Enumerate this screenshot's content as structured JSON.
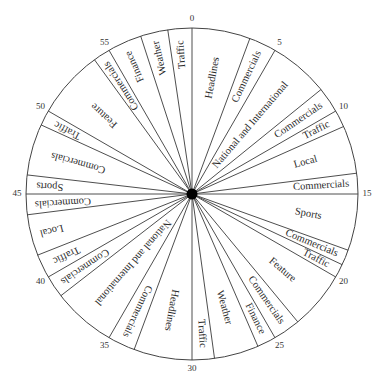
{
  "chart_data": {
    "type": "pie",
    "title": "",
    "unit": "minutes",
    "total": 60,
    "start_angle": "top (0 at 12 o'clock), clockwise",
    "tick_labels": [
      "0",
      "5",
      "10",
      "15",
      "20",
      "25",
      "30",
      "35",
      "40",
      "45",
      "50",
      "55"
    ],
    "tick_values": [
      0,
      5,
      10,
      15,
      20,
      25,
      30,
      35,
      40,
      45,
      50,
      55
    ],
    "segments": [
      {
        "label": "Headlines",
        "start": 0,
        "end": 3.4
      },
      {
        "label": "Commercials",
        "start": 3.4,
        "end": 5
      },
      {
        "label": "National and International",
        "start": 5,
        "end": 8.5
      },
      {
        "label": "Commercials",
        "start": 8.5,
        "end": 10
      },
      {
        "label": "Traffic",
        "start": 10,
        "end": 11
      },
      {
        "label": "Local",
        "start": 11,
        "end": 13.8
      },
      {
        "label": "Commercials",
        "start": 13.8,
        "end": 15
      },
      {
        "label": "Sports",
        "start": 15,
        "end": 18.3
      },
      {
        "label": "Commercials",
        "start": 18.3,
        "end": 19.2
      },
      {
        "label": "Traffic",
        "start": 19.2,
        "end": 20
      },
      {
        "label": "Feature",
        "start": 20,
        "end": 23.4
      },
      {
        "label": "Commercials",
        "start": 23.4,
        "end": 25
      },
      {
        "label": "Finance",
        "start": 25,
        "end": 26.1
      },
      {
        "label": "Weather",
        "start": 26.1,
        "end": 28.7
      },
      {
        "label": "Traffic",
        "start": 28.7,
        "end": 30
      },
      {
        "label": "Headlines",
        "start": 30,
        "end": 33.4
      },
      {
        "label": "Commercials",
        "start": 33.4,
        "end": 35
      },
      {
        "label": "National and International",
        "start": 35,
        "end": 38.7
      },
      {
        "label": "Commercials",
        "start": 38.7,
        "end": 40
      },
      {
        "label": "Traffic",
        "start": 40,
        "end": 41.4
      },
      {
        "label": "Local",
        "start": 41.4,
        "end": 43.8
      },
      {
        "label": "Commercials",
        "start": 43.8,
        "end": 45
      },
      {
        "label": "Sports",
        "start": 45,
        "end": 46.1
      },
      {
        "label": "Commercials",
        "start": 46.1,
        "end": 49.1
      },
      {
        "label": "Traffic",
        "start": 49.1,
        "end": 50
      },
      {
        "label": "Feature",
        "start": 50,
        "end": 54
      },
      {
        "label": "Commercials",
        "start": 54,
        "end": 55
      },
      {
        "label": "Finance",
        "start": 55,
        "end": 57
      },
      {
        "label": "Weather",
        "start": 57,
        "end": 58.6
      },
      {
        "label": "Traffic",
        "start": 58.6,
        "end": 60
      }
    ]
  },
  "colors": {
    "line": "#3a3a3a",
    "fill": "#ffffff",
    "hub": "#000000",
    "text": "#2a2a2a"
  }
}
